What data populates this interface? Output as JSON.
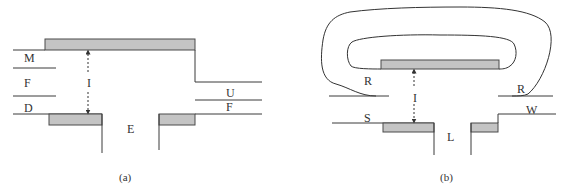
{
  "colors": {
    "line": "#3a3a3a",
    "plate_fill": "#c4c4c4",
    "plate_stroke": "#4a4a4a",
    "text": "#333333",
    "background": "#ffffff"
  },
  "panel_a": {
    "caption": "(a)",
    "labels": {
      "top_left": "M",
      "middle_left": "F",
      "gap": "I",
      "bottom_left": "D",
      "center_bottom": "E",
      "right_upper": "U",
      "right_lower": "F"
    }
  },
  "panel_b": {
    "caption": "(b)",
    "labels": {
      "left_upper": "R",
      "right_upper": "R",
      "gap": "I",
      "left_lower": "S",
      "center_bottom": "L",
      "right_lower": "W"
    }
  }
}
